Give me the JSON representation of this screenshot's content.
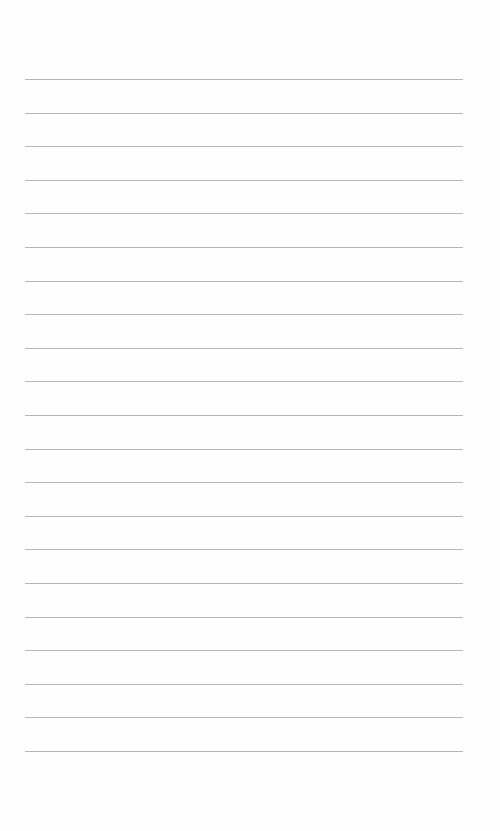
{
  "page": {
    "type": "blank-lined-paper",
    "background_color": "#fefefe",
    "rule_color": "#a9a9a9",
    "rule_count": 21,
    "first_rule_y": 79,
    "rule_spacing": 33.6,
    "rule_left": 25,
    "rule_width": 438
  }
}
